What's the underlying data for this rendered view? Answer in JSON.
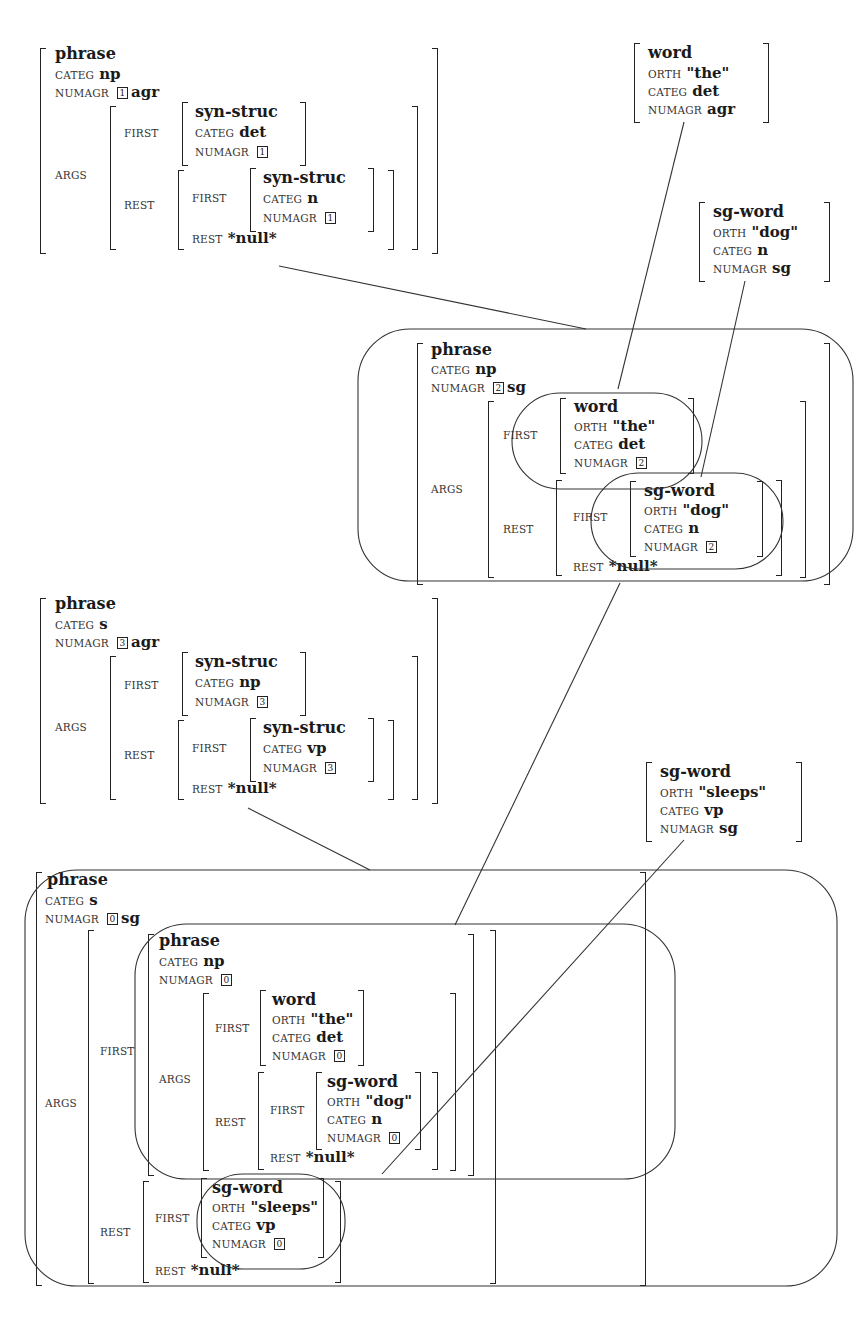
{
  "diagram": {
    "labels": {
      "categ": "CATEG",
      "numagr": "NUMAGR",
      "orth": "ORTH",
      "args": "ARGS",
      "first": "FIRST",
      "rest": "REST",
      "null": "*null*"
    },
    "fs1": {
      "type": "phrase",
      "categ": "np",
      "numagr_tag": "1",
      "numagr": "agr",
      "args_first": {
        "type": "syn-struc",
        "categ": "det",
        "numagr_tag": "1"
      },
      "args_rest_first": {
        "type": "syn-struc",
        "categ": "n",
        "numagr_tag": "1"
      },
      "args_rest_rest": "*null*"
    },
    "lex_the": {
      "type": "word",
      "orth": "\"the\"",
      "categ": "det",
      "numagr": "agr"
    },
    "lex_dog": {
      "type": "sg-word",
      "orth": "\"dog\"",
      "categ": "n",
      "numagr": "sg"
    },
    "fs2": {
      "type": "phrase",
      "categ": "np",
      "numagr_tag": "2",
      "numagr": "sg",
      "args_first": {
        "type": "word",
        "orth": "\"the\"",
        "categ": "det",
        "numagr_tag": "2"
      },
      "args_rest_first": {
        "type": "sg-word",
        "orth": "\"dog\"",
        "categ": "n",
        "numagr_tag": "2"
      },
      "args_rest_rest": "*null*"
    },
    "fs3": {
      "type": "phrase",
      "categ": "s",
      "numagr_tag": "3",
      "numagr": "agr",
      "args_first": {
        "type": "syn-struc",
        "categ": "np",
        "numagr_tag": "3"
      },
      "args_rest_first": {
        "type": "syn-struc",
        "categ": "vp",
        "numagr_tag": "3"
      },
      "args_rest_rest": "*null*"
    },
    "lex_sleeps": {
      "type": "sg-word",
      "orth": "\"sleeps\"",
      "categ": "vp",
      "numagr": "sg"
    },
    "fs4": {
      "type": "phrase",
      "categ": "s",
      "numagr_tag": "0",
      "numagr": "sg",
      "args_first": {
        "type": "phrase",
        "categ": "np",
        "numagr_tag": "0",
        "args_first": {
          "type": "word",
          "orth": "\"the\"",
          "categ": "det",
          "numagr_tag": "0"
        },
        "args_rest_first": {
          "type": "sg-word",
          "orth": "\"dog\"",
          "categ": "n",
          "numagr_tag": "0"
        },
        "args_rest_rest": "*null*"
      },
      "args_rest_first": {
        "type": "sg-word",
        "orth": "\"sleeps\"",
        "categ": "vp",
        "numagr_tag": "0"
      },
      "args_rest_rest": "*null*"
    }
  }
}
